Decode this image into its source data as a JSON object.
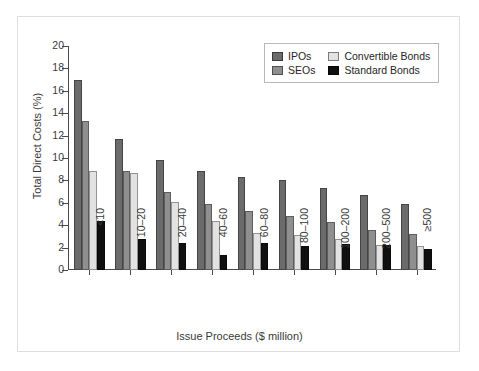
{
  "chart_data": {
    "type": "bar",
    "title": "",
    "xlabel": "Issue Proceeds ($ million)",
    "ylabel": "Total Direct Costs (%)",
    "categories": [
      "<10",
      "10–20",
      "20–40",
      "40–60",
      "60–80",
      "80–100",
      "100–200",
      "200–500",
      "≥500"
    ],
    "series": [
      {
        "name": "IPOs",
        "color": "#6b6b6b",
        "values": [
          17.0,
          11.7,
          9.8,
          8.8,
          8.3,
          8.0,
          7.3,
          6.7,
          5.9
        ]
      },
      {
        "name": "SEOs",
        "color": "#8f8f8f",
        "values": [
          13.3,
          8.8,
          7.0,
          5.9,
          5.25,
          4.85,
          4.3,
          3.55,
          3.2
        ]
      },
      {
        "name": "Convertible Bonds",
        "color": "#e2e2e2",
        "values": [
          8.8,
          8.7,
          6.1,
          4.35,
          3.3,
          3.1,
          2.8,
          2.2,
          2.15
        ]
      },
      {
        "name": "Standard Bonds",
        "color": "#101010",
        "values": [
          4.4,
          2.8,
          2.4,
          1.35,
          2.4,
          2.15,
          2.35,
          2.25,
          1.9
        ]
      }
    ],
    "ylim": [
      0,
      20
    ],
    "yticks": [
      0,
      2,
      4,
      6,
      8,
      10,
      12,
      14,
      16,
      18,
      20
    ],
    "grid": false,
    "legend_position": "top-right"
  },
  "legend": {
    "entries": [
      {
        "label": "IPOs"
      },
      {
        "label": "Convertible Bonds"
      },
      {
        "label": "SEOs"
      },
      {
        "label": "Standard Bonds"
      }
    ]
  }
}
